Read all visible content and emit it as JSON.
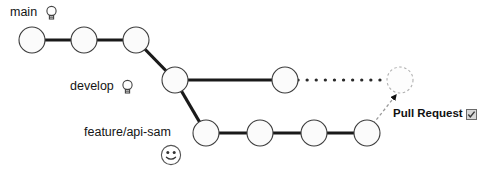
{
  "diagram": {
    "type": "git-branch-graph",
    "background_color": "#ffffff",
    "node": {
      "radius": 13,
      "fill": "#fbfbfb",
      "stroke": "#3c3c3c",
      "stroke_width": 1.1
    },
    "edge": {
      "color": "#1a1a1a",
      "width": 3.2,
      "dotted_color": "#2a2a2a",
      "dashed_color": "#8a8a8a"
    }
  },
  "branches": [
    {
      "id": "main",
      "label": "main",
      "icon": "lightbulb-icon",
      "y": 40,
      "commits": [
        {
          "id": "m1",
          "x": 32,
          "y": 40,
          "style": "solid"
        },
        {
          "id": "m2",
          "x": 84,
          "y": 40,
          "style": "solid"
        },
        {
          "id": "m3",
          "x": 136,
          "y": 40,
          "style": "solid"
        }
      ]
    },
    {
      "id": "develop",
      "label": "develop",
      "icon": "lightbulb-icon",
      "y": 80,
      "commits": [
        {
          "id": "d1",
          "x": 175,
          "y": 80,
          "style": "solid"
        },
        {
          "id": "d2",
          "x": 285,
          "y": 80,
          "style": "solid"
        },
        {
          "id": "d3",
          "x": 400,
          "y": 80,
          "style": "dashed"
        }
      ]
    },
    {
      "id": "feature",
      "label": "feature/api-sam",
      "icon": "smiley-icon",
      "y": 133,
      "commits": [
        {
          "id": "f1",
          "x": 206,
          "y": 133,
          "style": "solid"
        },
        {
          "id": "f2",
          "x": 260,
          "y": 133,
          "style": "solid"
        },
        {
          "id": "f3",
          "x": 314,
          "y": 133,
          "style": "solid"
        },
        {
          "id": "f4",
          "x": 367,
          "y": 133,
          "style": "solid"
        }
      ]
    }
  ],
  "edges": [
    {
      "from": "m1",
      "to": "m2",
      "style": "solid"
    },
    {
      "from": "m2",
      "to": "m3",
      "style": "solid"
    },
    {
      "from": "m3",
      "to": "d1",
      "style": "solid"
    },
    {
      "from": "d1",
      "to": "d2",
      "style": "solid"
    },
    {
      "from": "d2",
      "to": "d3",
      "style": "dotted"
    },
    {
      "from": "d1",
      "to": "f1",
      "style": "solid"
    },
    {
      "from": "f1",
      "to": "f2",
      "style": "solid"
    },
    {
      "from": "f2",
      "to": "f3",
      "style": "solid"
    },
    {
      "from": "f3",
      "to": "f4",
      "style": "solid"
    },
    {
      "from": "f4",
      "to": "d3",
      "style": "dashed-arrow"
    }
  ],
  "annotations": {
    "pull_request": {
      "label": "Pull Request",
      "icon": "checkbox-icon",
      "x": 393,
      "y": 108
    }
  }
}
